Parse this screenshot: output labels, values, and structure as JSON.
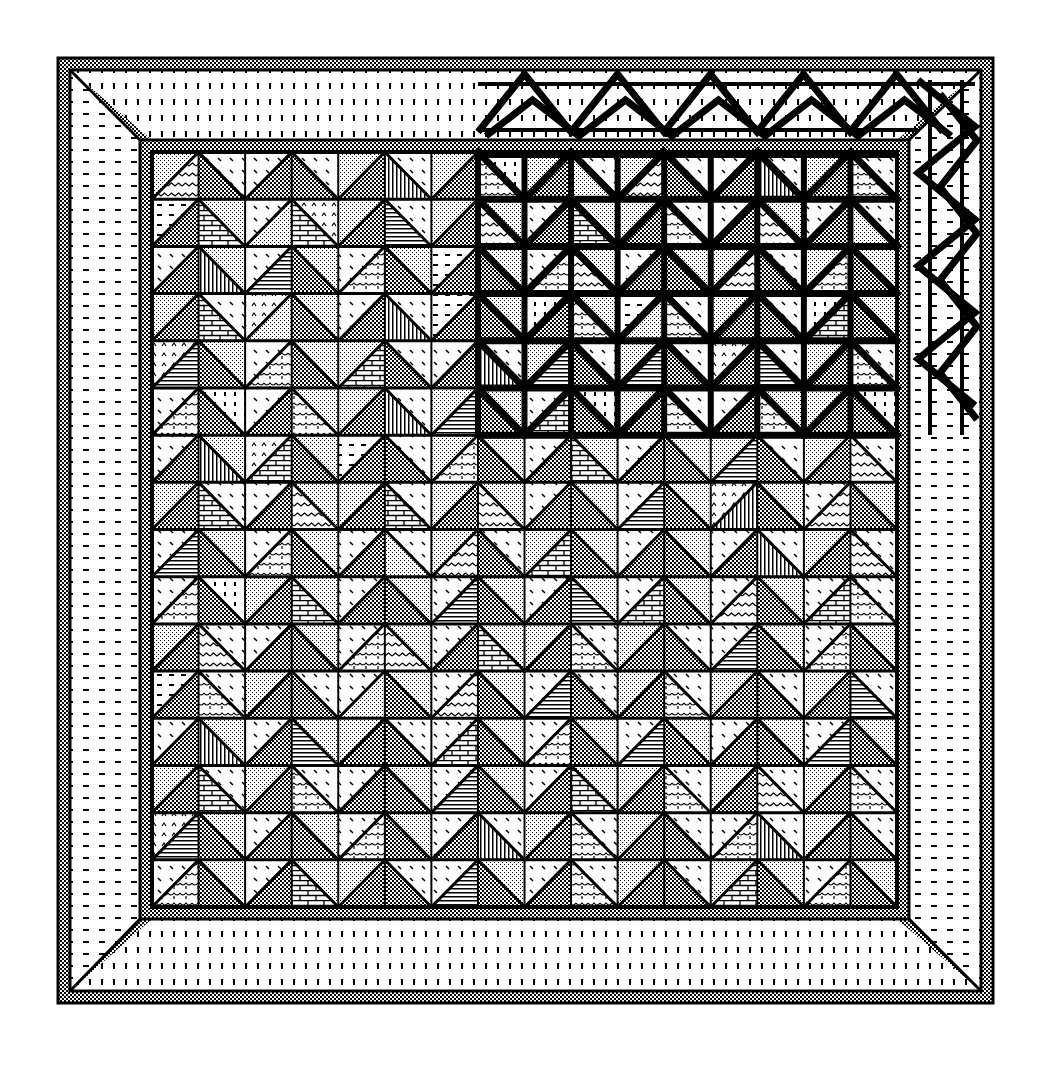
{
  "colors": {
    "ink": "#000000",
    "paper": "#ffffff"
  },
  "frame": {
    "outer": [
      58,
      58,
      993,
      1003
    ],
    "inner_border_width": 12,
    "grid": [
      152,
      152,
      897,
      907
    ]
  },
  "grid": {
    "cols": 16,
    "rows": 16
  },
  "patterns": {
    "a": "fine-dots",
    "b": "checker",
    "c": "wavy",
    "d": "bricks",
    "e": "scallops",
    "f": "vertical-lines",
    "g": "horizontal-lines",
    "h": "dashes",
    "i": "diagonal-dashes",
    "j": "carets",
    "k": "dotted-vertical"
  },
  "cells": [
    [
      "ac",
      "ib",
      "ib",
      "ib",
      "ab",
      "if",
      "ab",
      "ke",
      "ab",
      "ia",
      "ac",
      "ib",
      "ib",
      "if",
      "ab",
      "ie"
    ],
    [
      "hb",
      "ad",
      "ia",
      "jd",
      "ab",
      "ig",
      "ab",
      "ac",
      "ib",
      "ad",
      "ab",
      "ie",
      "ib",
      "ac",
      "ib",
      "ia"
    ],
    [
      "ib",
      "af",
      "ig",
      "ab",
      "ie",
      "ab",
      "hb",
      "ab",
      "ie",
      "ac",
      "ib",
      "ab",
      "ac",
      "ib",
      "ae",
      "ab"
    ],
    [
      "ab",
      "id",
      "ja",
      "ab",
      "ib",
      "if",
      "hb",
      "ab",
      "kb",
      "ae",
      "ha",
      "ie",
      "ab",
      "ib",
      "kd",
      "ab"
    ],
    [
      "jg",
      "ab",
      "ie",
      "ab",
      "ad",
      "ib",
      "ib",
      "if",
      "ag",
      "ib",
      "ag",
      "ib",
      "jb",
      "ig",
      "ab",
      "ie"
    ],
    [
      "ie",
      "kb",
      "ib",
      "ae",
      "ab",
      "if",
      "ag",
      "ab",
      "id",
      "kb",
      "ab",
      "ie",
      "ib",
      "ae",
      "ab",
      "kb"
    ],
    [
      "ib",
      "af",
      "jd",
      "ab",
      "hb",
      "ib",
      "ae",
      "ab",
      "ib",
      "ad",
      "ib",
      "ab",
      "ag",
      "ib",
      "ab",
      "ic"
    ],
    [
      "ab",
      "id",
      "ib",
      "ac",
      "ab",
      "id",
      "ab",
      "ac",
      "ib",
      "ab",
      "ig",
      "ab",
      "jf",
      "ab",
      "ic",
      "ab"
    ],
    [
      "ig",
      "ab",
      "ie",
      "ab",
      "ib",
      "ia",
      "ac",
      "ib",
      "ad",
      "ab",
      "ib",
      "ab",
      "ib",
      "if",
      "ab",
      "ic"
    ],
    [
      "ie",
      "kb",
      "ab",
      "ad",
      "ib",
      "ab",
      "ig",
      "ab",
      "ib",
      "ag",
      "id",
      "ab",
      "ic",
      "ab",
      "id",
      "ie"
    ],
    [
      "ab",
      "ic",
      "ib",
      "ab",
      "ie",
      "ac",
      "ib",
      "ad",
      "ab",
      "ie",
      "ab",
      "ib",
      "ig",
      "ab",
      "ie",
      "ab"
    ],
    [
      "hb",
      "ie",
      "ab",
      "ib",
      "ia",
      "ab",
      "ic",
      "ab",
      "ig",
      "ib",
      "ab",
      "ie",
      "ab",
      "ib",
      "ab",
      "ig"
    ],
    [
      "ib",
      "af",
      "ib",
      "ag",
      "ab",
      "ib",
      "id",
      "ab",
      "ie",
      "ab",
      "ig",
      "ab",
      "ib",
      "ab",
      "ig",
      "ab"
    ],
    [
      "ab",
      "id",
      "ab",
      "ie",
      "ib",
      "ab",
      "ig",
      "ab",
      "ib",
      "ad",
      "ab",
      "ie",
      "ab",
      "ic",
      "ab",
      "ie"
    ],
    [
      "jg",
      "ab",
      "ib",
      "ab",
      "ie",
      "ab",
      "ib",
      "if",
      "ab",
      "ie",
      "ab",
      "ib",
      "ie",
      "if",
      "ab",
      "ib"
    ],
    [
      "ie",
      "ab",
      "ib",
      "ad",
      "ab",
      "ib",
      "ig",
      "ab",
      "ib",
      "ie",
      "ab",
      "ib",
      "ad",
      "ab",
      "ie",
      "ab"
    ]
  ],
  "bold_region": {
    "col_start": 7,
    "col_end": 16,
    "row_start": 0,
    "row_end": 6
  },
  "zigzag_border": {
    "top": {
      "x_start": 478,
      "x_end": 975,
      "y_top": 72,
      "y_bottom": 135,
      "period": 93
    },
    "right": {
      "x_left": 918,
      "x_right": 975,
      "y_start": 80,
      "y_end": 435
    }
  }
}
